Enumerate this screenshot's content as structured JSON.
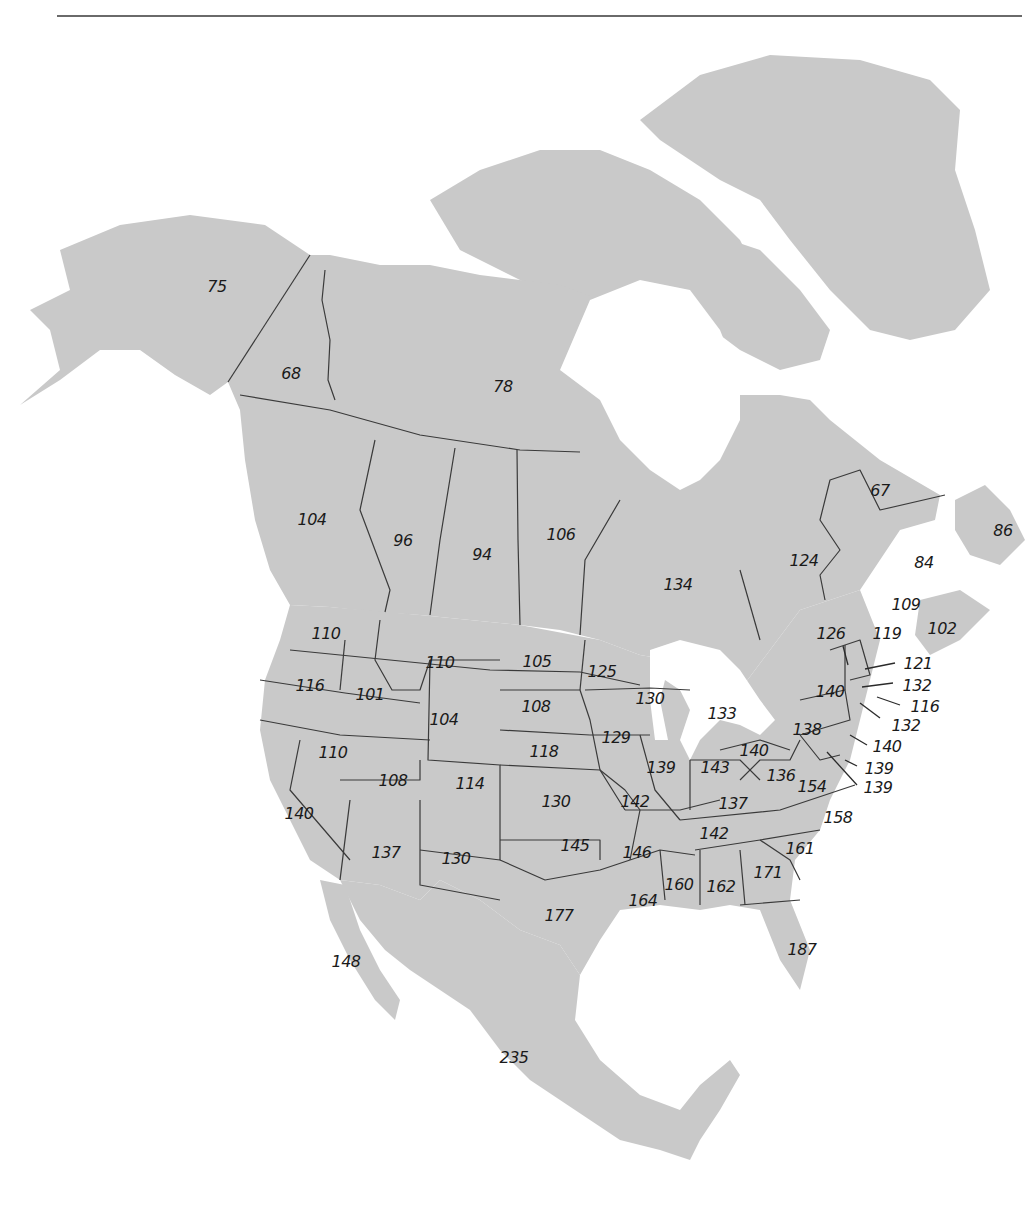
{
  "figure": {
    "type": "choropleth-style labeled map",
    "region": "North America (Canada provinces/territories, US states, Alaska, Greenland, Mexico)",
    "land_color": "#c9c9c9",
    "border_color": "#3a3a3a",
    "label_style": "italic numbers"
  },
  "labels": {
    "alaska": "75",
    "yukon": "68",
    "northwest_territories": "78",
    "british_columbia": "104",
    "alberta": "96",
    "saskatchewan": "94",
    "manitoba": "106",
    "ontario": "134",
    "quebec": "124",
    "labrador": "67",
    "newfoundland": "86",
    "prince_edward_island": "84",
    "new_brunswick": "109",
    "nova_scotia": "102",
    "washington": "110",
    "oregon": "116",
    "idaho": "101",
    "montana": "110",
    "wyoming": "104",
    "north_dakota": "105",
    "south_dakota": "108",
    "minnesota": "125",
    "wisconsin": "130",
    "michigan": "133",
    "iowa": "129",
    "nebraska": "118",
    "nevada": "110",
    "utah": "108",
    "colorado": "114",
    "kansas": "130",
    "missouri": "142",
    "illinois": "139",
    "indiana": "143",
    "ohio": "140",
    "kentucky": "137",
    "west_virginia": "136",
    "virginia": "154",
    "pennsylvania": "138",
    "new_york": "140",
    "vermont": "126",
    "maine": "119",
    "new_hampshire": "121",
    "massachusetts": "132",
    "rhode_island": "116",
    "connecticut": "132",
    "new_jersey": "140",
    "delaware": "139",
    "maryland": "139",
    "california": "140",
    "arizona": "137",
    "new_mexico": "130",
    "oklahoma": "145",
    "texas": "177",
    "arkansas": "146",
    "louisiana": "164",
    "mississippi": "160",
    "alabama": "162",
    "tennessee": "142",
    "georgia": "171",
    "south_carolina": "161",
    "north_carolina": "158",
    "florida": "187",
    "baja_california": "148",
    "mexico": "235"
  }
}
